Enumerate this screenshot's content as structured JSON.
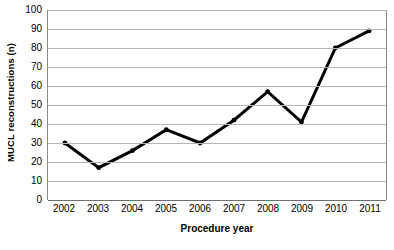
{
  "chart_data": {
    "type": "line",
    "title": "",
    "xlabel": "Procedure year",
    "ylabel": "MUCL reconstructions (n)",
    "categories": [
      "2002",
      "2003",
      "2004",
      "2005",
      "2006",
      "2007",
      "2008",
      "2009",
      "2010",
      "2011"
    ],
    "values": [
      30,
      17,
      26,
      37,
      30,
      42,
      57,
      41,
      80,
      89
    ],
    "ylim": [
      0,
      100
    ],
    "yticks": [
      0,
      10,
      20,
      30,
      40,
      50,
      60,
      70,
      80,
      90,
      100
    ],
    "ytick_labels": [
      "0",
      "10",
      "20",
      "30",
      "40",
      "50",
      "60",
      "70",
      "80",
      "90",
      "100"
    ],
    "grid": true,
    "legend": false,
    "legend_position": "none",
    "series": [
      {
        "name": "MUCL reconstructions",
        "values": [
          30,
          17,
          26,
          37,
          30,
          42,
          57,
          41,
          80,
          89
        ]
      }
    ],
    "line_color": "#000000",
    "marker": "circle",
    "grid_color": "#b6b6b6",
    "axis_color": "#8a8a8a",
    "background_color": "#ffffff"
  }
}
